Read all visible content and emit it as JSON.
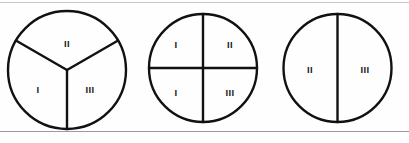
{
  "figure": {
    "stroke_color": "#111111",
    "label_color": "#1a1a1a",
    "background_color": "#fefefe",
    "rule_top_color": "#c9c9cc",
    "rule_bottom_color": "#9a9a9e"
  },
  "circles": [
    {
      "name": "circle-thirds",
      "division": "three-sectors",
      "segment_count": 3,
      "labels": {
        "top": "II",
        "lower_left": "I",
        "lower_right": "III"
      },
      "label_list": [
        "II",
        "I",
        "III"
      ]
    },
    {
      "name": "circle-quarters",
      "division": "four-quadrants",
      "segment_count": 4,
      "labels": {
        "top_left": "I",
        "top_right": "II",
        "bottom_left": "I",
        "bottom_right": "III"
      },
      "label_list": [
        "I",
        "II",
        "I",
        "III"
      ]
    },
    {
      "name": "circle-halves",
      "division": "two-halves",
      "segment_count": 2,
      "labels": {
        "left": "II",
        "right": "III"
      },
      "label_list": [
        "II",
        "III"
      ]
    }
  ]
}
